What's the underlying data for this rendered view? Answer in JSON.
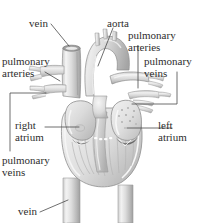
{
  "figure": {
    "type": "anatomical-diagram",
    "style": "grayscale pencil/airbrush illustration",
    "background_color": "#ffffff",
    "line_color": "#444444",
    "text_color": "#2e2e2e",
    "width": 199,
    "height": 223
  },
  "labels": {
    "vein_top": "vein",
    "aorta": "aorta",
    "pulmonary_arteries_right": "pulmonary\narteries",
    "pulmonary_arteries_left": "pulmonary\narteries",
    "pulmonary_veins_right": "pulmonary\nveins",
    "pulmonary_veins_left": "pulmonary\nveins",
    "right_atrium": "right\natrium",
    "left_atrium": "left\natrium",
    "vein_bottom": "vein"
  },
  "label_lines": [
    {
      "name": "vein-top",
      "text": "vein"
    },
    {
      "name": "aorta",
      "text": "aorta"
    },
    {
      "name": "pulmonary-arteries-upper-right",
      "text": "pulmonary arteries"
    },
    {
      "name": "pulmonary-arteries-left",
      "text": "pulmonary arteries"
    },
    {
      "name": "pulmonary-veins-right",
      "text": "pulmonary veins"
    },
    {
      "name": "pulmonary-veins-left",
      "text": "pulmonary veins"
    },
    {
      "name": "right-atrium",
      "text": "right atrium"
    },
    {
      "name": "left-atrium",
      "text": "left atrium"
    },
    {
      "name": "vein-bottom",
      "text": "vein"
    }
  ],
  "anatomy_parts": [
    "superior vena cava",
    "aortic arch",
    "pulmonary trunk",
    "pulmonary arteries",
    "pulmonary veins",
    "right atrium",
    "left atrium",
    "right ventricle",
    "left ventricle",
    "atrioventricular valves",
    "inferior vena cava",
    "descending aorta"
  ]
}
